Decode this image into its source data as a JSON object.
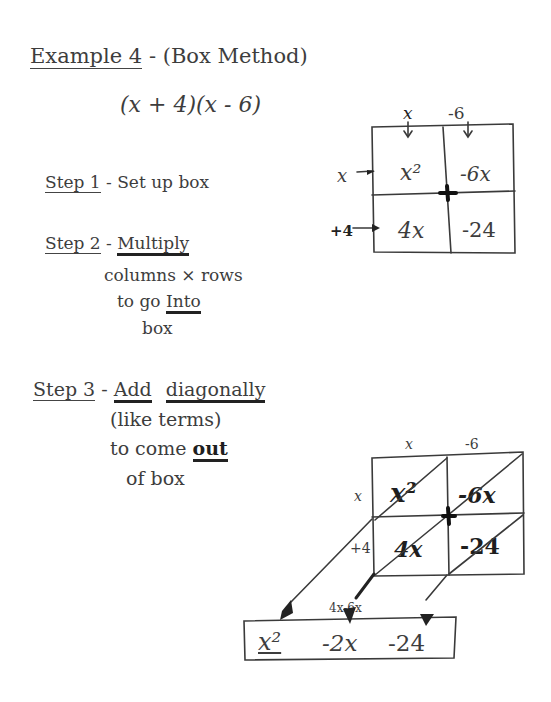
{
  "title": {
    "label": "Example 4",
    "separator": "-",
    "method": "(Box Method)"
  },
  "expression": "(x + 4)(x - 6)",
  "box1": {
    "col_headers": [
      "x",
      "-6"
    ],
    "row_headers": [
      "x",
      "+4"
    ],
    "cells": [
      [
        "x²",
        "-6x"
      ],
      [
        "4x",
        "-24"
      ]
    ]
  },
  "steps": [
    {
      "label": "Step 1",
      "separator": "-",
      "lines": [
        "Set up box"
      ]
    },
    {
      "label": "Step 2",
      "separator": "-",
      "keyword": "Multiply",
      "lines": [
        "columns × rows",
        "to go",
        "Into",
        "box"
      ]
    },
    {
      "label": "Step 3",
      "separator": "-",
      "keyword1": "Add",
      "keyword2": "diagonally",
      "lines": [
        "(like terms)",
        "to come",
        "out",
        "of box"
      ]
    }
  ],
  "box2": {
    "col_headers": [
      "x",
      "-6"
    ],
    "row_headers": [
      "x",
      "+4"
    ],
    "cells": [
      [
        "x²",
        "-6x"
      ],
      [
        "4x",
        "-24"
      ]
    ],
    "middle_sum_label": "4x-6x"
  },
  "result": {
    "terms": [
      "x²",
      "-2x",
      "-24"
    ]
  }
}
